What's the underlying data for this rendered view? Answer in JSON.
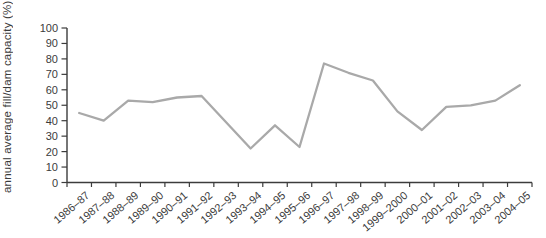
{
  "chart_data": {
    "type": "line",
    "title": "",
    "xlabel": "",
    "ylabel": "annual average fill/dam capacity (%)",
    "categories": [
      "1986–87",
      "1987–88",
      "1988–89",
      "1989–90",
      "1990–91",
      "1991–92",
      "1992–93",
      "1993–94",
      "1994–95",
      "1995–96",
      "1996–97",
      "1997–98",
      "1998–99",
      "1999–2000",
      "2000–01",
      "2001–02",
      "2002–03",
      "2003–04",
      "2004–05"
    ],
    "values": [
      45,
      40,
      53,
      52,
      55,
      56,
      39,
      22,
      37,
      23,
      77,
      71,
      66,
      46,
      34,
      49,
      50,
      53,
      63
    ],
    "ylim": [
      0,
      100
    ],
    "yticks": [
      0,
      10,
      20,
      30,
      40,
      50,
      60,
      70,
      80,
      90,
      100
    ],
    "grid": false,
    "legend": "none",
    "colors": {
      "line": "#a9a9a9",
      "axis": "#3c3c3c",
      "text": "#3b3b3b",
      "background": "#ffffff"
    }
  }
}
